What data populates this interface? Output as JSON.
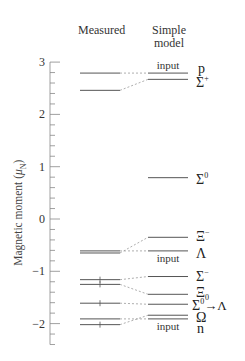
{
  "chart_data": {
    "type": "level-diagram",
    "title": "",
    "columns": [
      "Measured",
      "Simple model"
    ],
    "ylabel": "Magnetic moment (μN)",
    "ylabel_main": "Magnetic moment (",
    "ylabel_mu": "μ",
    "ylabel_sub": "N",
    "ylabel_close": ")",
    "ylim": [
      -2.4,
      3.0
    ],
    "yticks": [
      3,
      2,
      1,
      0,
      -1,
      -2
    ],
    "ytick_labels": [
      "3",
      "2",
      "1",
      "0",
      "−1",
      "−2"
    ],
    "minor_tick_step": 0.2,
    "particles": [
      {
        "name": "p",
        "label": "p",
        "sup": "",
        "sub": "",
        "measured": 2.79,
        "model": 2.79,
        "model_note": "input",
        "measured_error": false
      },
      {
        "name": "Sigma+",
        "label": "Σ",
        "sup": "+",
        "sub": "",
        "measured": 2.46,
        "model": 2.67,
        "model_note": "",
        "measured_error": false
      },
      {
        "name": "Sigma0",
        "label": "Σ",
        "sup": "0",
        "sub": "",
        "measured": null,
        "model": 0.79,
        "model_note": "",
        "measured_error": false
      },
      {
        "name": "Xi-",
        "label": "Ξ",
        "sup": "−",
        "sub": "",
        "measured": -0.65,
        "model": -0.35,
        "model_note": "",
        "measured_error": false
      },
      {
        "name": "Lambda",
        "label": "Λ",
        "sup": "",
        "sub": "",
        "measured": -0.61,
        "model": -0.61,
        "model_note": "input",
        "measured_error": false
      },
      {
        "name": "Sigma-",
        "label": "Σ",
        "sup": "−",
        "sub": "",
        "measured": -1.16,
        "model": -1.1,
        "model_note": "",
        "measured_error": true
      },
      {
        "name": "Xi0",
        "label": "Ξ",
        "sup": "",
        "sub": "0",
        "measured": -1.25,
        "model": -1.44,
        "model_note": "",
        "measured_error": true
      },
      {
        "name": "Sigma0->Lambda",
        "label": "Σ",
        "sup": "0",
        "sub": "",
        "suffix": "→Λ",
        "measured": -1.61,
        "model": -1.63,
        "model_note": "",
        "measured_error": true
      },
      {
        "name": "Omega-",
        "label": "Ω",
        "sup": "",
        "sub": "",
        "measured": -2.02,
        "model": -1.84,
        "model_note": "",
        "measured_error": true
      },
      {
        "name": "n",
        "label": "n",
        "sup": "",
        "sub": "",
        "measured": -1.91,
        "model": -1.91,
        "model_note": "input",
        "measured_error": false
      }
    ],
    "grid": false,
    "legend": "none"
  },
  "header": {
    "measured": "Measured",
    "model_line1": "Simple",
    "model_line2": "model"
  },
  "labels": {
    "input": "input"
  },
  "colors": {
    "line": "#555555",
    "axis": "#888888",
    "text": "#333333"
  }
}
